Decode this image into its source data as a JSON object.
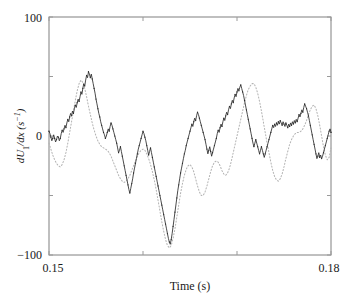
{
  "figure": {
    "name": "velocity-gradient-time-series",
    "background": "#ffffff"
  },
  "chart_data": {
    "type": "line",
    "title": "",
    "subtitle": "",
    "xlabel": "Time (s)",
    "ylabel": "dU1/dx (s−1)",
    "ylabel_parts": {
      "d": "d",
      "U": "U",
      "sub": "1",
      "slash_dx": "/dx",
      "units": "(s",
      "units_exp": "−1",
      "units_close": ")"
    },
    "xlim": [
      0.15,
      0.18
    ],
    "ylim": [
      -100,
      100
    ],
    "xticks": [
      0.15,
      0.16,
      0.17,
      0.18
    ],
    "xticklabels": [
      "0.15",
      "",
      "",
      "0.18"
    ],
    "yticks": [
      -100,
      -50,
      0,
      50,
      100
    ],
    "yticklabels": [
      "−100",
      "",
      "0",
      "",
      "100"
    ],
    "grid": false,
    "legend": "none",
    "axis_color": "#808080",
    "series": [
      {
        "name": "measured",
        "style": "solid-with-dot-markers",
        "color": "#2b2b2b",
        "marker": "dot",
        "x": [
          0.15,
          0.1501,
          0.1502,
          0.1503,
          0.1504,
          0.1505,
          0.1506,
          0.1507,
          0.1508,
          0.1509,
          0.151,
          0.1511,
          0.1512,
          0.1513,
          0.1514,
          0.1515,
          0.1516,
          0.1517,
          0.1518,
          0.1519,
          0.152,
          0.1521,
          0.1522,
          0.1523,
          0.1524,
          0.1525,
          0.1526,
          0.1527,
          0.1528,
          0.1529,
          0.153,
          0.1531,
          0.1532,
          0.1533,
          0.1534,
          0.1535,
          0.1536,
          0.1537,
          0.1538,
          0.1539,
          0.154,
          0.1541,
          0.1542,
          0.1543,
          0.1544,
          0.1545,
          0.1546,
          0.1547,
          0.1548,
          0.1549,
          0.155,
          0.1551,
          0.1552,
          0.1553,
          0.1554,
          0.1555,
          0.1556,
          0.1557,
          0.1558,
          0.1559,
          0.156,
          0.1561,
          0.1562,
          0.1563,
          0.1564,
          0.1565,
          0.1566,
          0.1567,
          0.1568,
          0.1569,
          0.157,
          0.1571,
          0.1572,
          0.1573,
          0.1574,
          0.1575,
          0.1576,
          0.1577,
          0.1578,
          0.1579,
          0.158,
          0.1581,
          0.1582,
          0.1583,
          0.1584,
          0.1585,
          0.1586,
          0.1587,
          0.1588,
          0.1589,
          0.159,
          0.1591,
          0.1592,
          0.1593,
          0.1594,
          0.1595,
          0.1596,
          0.1597,
          0.1598,
          0.1599,
          0.16,
          0.1601,
          0.1602,
          0.1603,
          0.1604,
          0.1605,
          0.1606,
          0.1607,
          0.1608,
          0.1609,
          0.161,
          0.1611,
          0.1612,
          0.1613,
          0.1614,
          0.1615,
          0.1616,
          0.1617,
          0.1618,
          0.1619,
          0.162,
          0.1621,
          0.1622,
          0.1623,
          0.1624,
          0.1625,
          0.1626,
          0.1627,
          0.1628,
          0.1629,
          0.163,
          0.1631,
          0.1632,
          0.1633,
          0.1634,
          0.1635,
          0.1636,
          0.1637,
          0.1638,
          0.1639,
          0.164,
          0.1641,
          0.1642,
          0.1643,
          0.1644,
          0.1645,
          0.1646,
          0.1647,
          0.1648,
          0.1649,
          0.165,
          0.1651,
          0.1652,
          0.1653,
          0.1654,
          0.1655,
          0.1656,
          0.1657,
          0.1658,
          0.1659,
          0.166,
          0.1661,
          0.1662,
          0.1663,
          0.1664,
          0.1665,
          0.1666,
          0.1667,
          0.1668,
          0.1669,
          0.167,
          0.1671,
          0.1672,
          0.1673,
          0.1674,
          0.1675,
          0.1676,
          0.1677,
          0.1678,
          0.1679,
          0.168,
          0.1681,
          0.1682,
          0.1683,
          0.1684,
          0.1685,
          0.1686,
          0.1687,
          0.1688,
          0.1689,
          0.169,
          0.1691,
          0.1692,
          0.1693,
          0.1694,
          0.1695,
          0.1696,
          0.1697,
          0.1698,
          0.1699,
          0.17,
          0.1701,
          0.1702,
          0.1703,
          0.1704,
          0.1705,
          0.1706,
          0.1707,
          0.1708,
          0.1709,
          0.171,
          0.1711,
          0.1712,
          0.1713,
          0.1714,
          0.1715,
          0.1716,
          0.1717,
          0.1718,
          0.1719,
          0.172,
          0.1721,
          0.1722,
          0.1723,
          0.1724,
          0.1725,
          0.1726,
          0.1727,
          0.1728,
          0.1729,
          0.173,
          0.1731,
          0.1732,
          0.1733,
          0.1734,
          0.1735,
          0.1736,
          0.1737,
          0.1738,
          0.1739,
          0.174,
          0.1741,
          0.1742,
          0.1743,
          0.1744,
          0.1745,
          0.1746,
          0.1747,
          0.1748,
          0.1749,
          0.175,
          0.1751,
          0.1752,
          0.1753,
          0.1754,
          0.1755,
          0.1756,
          0.1757,
          0.1758,
          0.1759,
          0.176,
          0.1761,
          0.1762,
          0.1763,
          0.1764,
          0.1765,
          0.1766,
          0.1767,
          0.1768,
          0.1769,
          0.177,
          0.1771,
          0.1772,
          0.1773,
          0.1774,
          0.1775,
          0.1776,
          0.1777,
          0.1778,
          0.1779,
          0.178,
          0.1781,
          0.1782,
          0.1783,
          0.1784,
          0.1785,
          0.1786,
          0.1787,
          0.1788,
          0.1789,
          0.179,
          0.1791,
          0.1792,
          0.1793,
          0.1794,
          0.1795,
          0.1796,
          0.1797,
          0.1798,
          0.1799,
          0.18
        ],
        "y": [
          4,
          2,
          -1,
          -4,
          -2,
          1,
          -2,
          -5,
          -3,
          0,
          -1,
          -4,
          -2,
          2,
          5,
          3,
          6,
          9,
          7,
          11,
          14,
          12,
          16,
          19,
          17,
          21,
          19,
          23,
          26,
          24,
          28,
          31,
          29,
          33,
          37,
          35,
          40,
          44,
          42,
          47,
          51,
          49,
          54,
          52,
          49,
          52,
          48,
          44,
          40,
          36,
          31,
          27,
          23,
          19,
          16,
          12,
          9,
          6,
          3,
          1,
          -2,
          0,
          3,
          6,
          4,
          8,
          11,
          9,
          6,
          3,
          0,
          -3,
          -6,
          -10,
          -14,
          -12,
          -9,
          -13,
          -17,
          -21,
          -25,
          -29,
          -33,
          -37,
          -41,
          -45,
          -48,
          -44,
          -40,
          -36,
          -31,
          -27,
          -23,
          -19,
          -15,
          -11,
          -8,
          -5,
          -2,
          1,
          4,
          2,
          -1,
          -4,
          -8,
          -12,
          -16,
          -13,
          -10,
          -14,
          -18,
          -22,
          -26,
          -30,
          -34,
          -38,
          -42,
          -46,
          -50,
          -54,
          -58,
          -62,
          -66,
          -70,
          -74,
          -78,
          -82,
          -86,
          -89,
          -91,
          -87,
          -82,
          -76,
          -70,
          -64,
          -58,
          -52,
          -46,
          -41,
          -36,
          -31,
          -27,
          -23,
          -19,
          -15,
          -12,
          -8,
          -5,
          -2,
          1,
          4,
          7,
          10,
          8,
          12,
          15,
          13,
          17,
          20,
          18,
          15,
          12,
          9,
          6,
          3,
          0,
          -3,
          -7,
          -11,
          -15,
          -12,
          -9,
          -13,
          -17,
          -14,
          -11,
          -8,
          -5,
          -2,
          2,
          5,
          3,
          7,
          10,
          8,
          12,
          15,
          13,
          17,
          20,
          18,
          22,
          25,
          23,
          27,
          30,
          28,
          32,
          35,
          33,
          37,
          40,
          38,
          41,
          43,
          40,
          37,
          34,
          30,
          26,
          22,
          18,
          14,
          10,
          6,
          2,
          -2,
          -6,
          -9,
          -6,
          -3,
          -6,
          -9,
          -12,
          -15,
          -12,
          -9,
          -12,
          -15,
          -18,
          -15,
          -12,
          -9,
          -6,
          -3,
          0,
          3,
          6,
          9,
          7,
          10,
          8,
          11,
          9,
          12,
          10,
          13,
          11,
          9,
          12,
          10,
          8,
          11,
          9,
          7,
          10,
          8,
          11,
          9,
          12,
          10,
          13,
          11,
          14,
          12,
          15,
          18,
          16,
          19,
          22,
          20,
          24,
          27,
          25,
          23,
          20,
          17,
          13,
          9,
          5,
          1,
          -3,
          -7,
          -11,
          -15,
          -19,
          -17,
          -14,
          -18,
          -16,
          -19,
          -17,
          -14,
          -11,
          -8,
          -5,
          -2,
          1,
          4,
          6,
          3
        ]
      },
      {
        "name": "smoothed",
        "style": "dotted",
        "color": "#b4b4b4",
        "marker": "none",
        "x": [
          0.15,
          0.1502,
          0.1504,
          0.1506,
          0.1508,
          0.151,
          0.1512,
          0.1514,
          0.1516,
          0.1518,
          0.152,
          0.1522,
          0.1524,
          0.1526,
          0.1528,
          0.153,
          0.1532,
          0.1534,
          0.1536,
          0.1538,
          0.154,
          0.1542,
          0.1544,
          0.1546,
          0.1548,
          0.155,
          0.1552,
          0.1554,
          0.1556,
          0.1558,
          0.156,
          0.1562,
          0.1564,
          0.1566,
          0.1568,
          0.157,
          0.1572,
          0.1574,
          0.1576,
          0.1578,
          0.158,
          0.1582,
          0.1584,
          0.1586,
          0.1588,
          0.159,
          0.1592,
          0.1594,
          0.1596,
          0.1598,
          0.16,
          0.1602,
          0.1604,
          0.1606,
          0.1608,
          0.161,
          0.1612,
          0.1614,
          0.1616,
          0.1618,
          0.162,
          0.1622,
          0.1624,
          0.1626,
          0.1628,
          0.163,
          0.1632,
          0.1634,
          0.1636,
          0.1638,
          0.164,
          0.1642,
          0.1644,
          0.1646,
          0.1648,
          0.165,
          0.1652,
          0.1654,
          0.1656,
          0.1658,
          0.166,
          0.1662,
          0.1664,
          0.1666,
          0.1668,
          0.167,
          0.1672,
          0.1674,
          0.1676,
          0.1678,
          0.168,
          0.1682,
          0.1684,
          0.1686,
          0.1688,
          0.169,
          0.1692,
          0.1694,
          0.1696,
          0.1698,
          0.17,
          0.1702,
          0.1704,
          0.1706,
          0.1708,
          0.171,
          0.1712,
          0.1714,
          0.1716,
          0.1718,
          0.172,
          0.1722,
          0.1724,
          0.1726,
          0.1728,
          0.173,
          0.1732,
          0.1734,
          0.1736,
          0.1738,
          0.174,
          0.1742,
          0.1744,
          0.1746,
          0.1748,
          0.175,
          0.1752,
          0.1754,
          0.1756,
          0.1758,
          0.176,
          0.1762,
          0.1764,
          0.1766,
          0.1768,
          0.177,
          0.1772,
          0.1774,
          0.1776,
          0.1778,
          0.178,
          0.1782,
          0.1784,
          0.1786,
          0.1788,
          0.179,
          0.1792,
          0.1794,
          0.1796,
          0.1798,
          0.18
        ],
        "y": [
          -6,
          -11,
          -16,
          -20,
          -23,
          -25,
          -26,
          -24,
          -20,
          -14,
          -6,
          3,
          12,
          21,
          30,
          38,
          44,
          47,
          45,
          40,
          33,
          25,
          18,
          11,
          5,
          0,
          -4,
          -7,
          -9,
          -10,
          -11,
          -12,
          -14,
          -17,
          -21,
          -25,
          -29,
          -33,
          -36,
          -38,
          -39,
          -38,
          -36,
          -33,
          -29,
          -25,
          -21,
          -17,
          -14,
          -12,
          -11,
          -12,
          -15,
          -19,
          -24,
          -30,
          -37,
          -45,
          -54,
          -63,
          -72,
          -80,
          -87,
          -92,
          -94,
          -92,
          -86,
          -78,
          -68,
          -58,
          -48,
          -40,
          -33,
          -28,
          -25,
          -24,
          -26,
          -30,
          -36,
          -42,
          -47,
          -50,
          -50,
          -47,
          -42,
          -36,
          -30,
          -25,
          -22,
          -21,
          -22,
          -25,
          -29,
          -32,
          -33,
          -31,
          -27,
          -21,
          -14,
          -7,
          0,
          7,
          14,
          21,
          28,
          34,
          39,
          42,
          44,
          44,
          41,
          36,
          29,
          21,
          12,
          3,
          -6,
          -14,
          -22,
          -29,
          -34,
          -37,
          -38,
          -36,
          -32,
          -26,
          -19,
          -13,
          -7,
          -3,
          0,
          2,
          3,
          3,
          4,
          6,
          9,
          13,
          18,
          22,
          25,
          26,
          23,
          17,
          9,
          0,
          -9,
          -16,
          -20,
          -18,
          -10
        ]
      }
    ],
    "annotations": []
  },
  "geometry": {
    "plot_left": 49,
    "plot_right": 331,
    "plot_top": 17,
    "plot_bottom": 255
  }
}
